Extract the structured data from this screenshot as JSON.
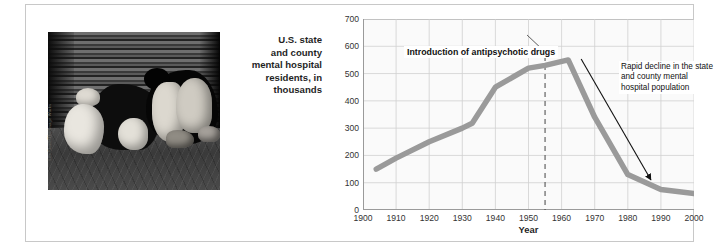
{
  "figure": {
    "photo": {
      "alt_description": "Black-and-white photograph of homeless people sleeping on a sidewalk against a corrugated metal shutter",
      "credit": "Les Stone/The Image Works"
    }
  },
  "chart_data": {
    "type": "line",
    "title": "",
    "ylabel": "U.S. state and county mental hospital residents, in thousands",
    "ylabel_lines": [
      "U.S. state",
      "and county",
      "mental hospital",
      "residents, in",
      "thousands"
    ],
    "xlabel": "Year",
    "xlim": [
      1900,
      2000
    ],
    "ylim": [
      0,
      700
    ],
    "yticks": [
      0,
      100,
      200,
      300,
      400,
      500,
      600,
      700
    ],
    "xticks": [
      1900,
      1910,
      1920,
      1930,
      1940,
      1950,
      1960,
      1970,
      1980,
      1990,
      2000
    ],
    "xtick_labels": [
      "1900",
      "1910",
      "1920",
      "1930",
      "1940",
      "1950",
      "1960",
      "1970",
      "1980",
      "1990",
      "2000"
    ],
    "grid": true,
    "legend": "none",
    "series": [
      {
        "name": "State and county mental hospital residents",
        "color": "#9a9a9a",
        "x": [
          1904,
          1910,
          1920,
          1930,
          1933,
          1940,
          1950,
          1955,
          1962,
          1970,
          1980,
          1990,
          2000
        ],
        "values": [
          150,
          190,
          250,
          300,
          318,
          450,
          520,
          530,
          550,
          340,
          130,
          75,
          60
        ]
      }
    ],
    "annotations": [
      {
        "id": "introduction-of-antipsychotic-drugs",
        "text": "Introduction of antipsychotic drugs",
        "marker": "dashed-vertical-line",
        "marker_x": 1955
      },
      {
        "id": "rapid-decline",
        "text": "Rapid decline in the state and county mental hospital population",
        "marker": "arrow",
        "arrow_points_to_x": 1987,
        "arrow_points_to_y": 110
      }
    ]
  }
}
